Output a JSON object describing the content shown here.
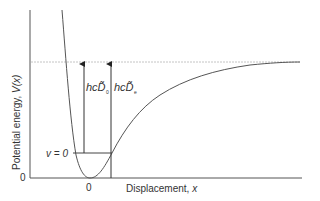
{
  "diagram": {
    "type": "morse-potential-energy-curve",
    "y_axis": {
      "label": "Potential energy, V(x)",
      "label_prefix": "Potential energy, ",
      "label_var": "V(x)",
      "zero_tick": "0"
    },
    "x_axis": {
      "label_prefix": "Displacement, ",
      "label_var": "x",
      "zero_tick": "0"
    },
    "level_label": "v = 0",
    "arrows": [
      {
        "id": "D0",
        "label_main": "hcD̃",
        "label_sub": "0",
        "from": "v = 0 level",
        "to": "dissociation limit"
      },
      {
        "id": "De",
        "label_main": "hcD̃",
        "label_sub": "e",
        "from": "potential minimum",
        "to": "dissociation limit"
      }
    ],
    "dissociation_line": {
      "style": "dashed",
      "color": "#bbbbbb"
    },
    "colors": {
      "axis": "#555555",
      "curve": "#555555",
      "text": "#333333",
      "dashed": "#bbbbbb"
    }
  }
}
